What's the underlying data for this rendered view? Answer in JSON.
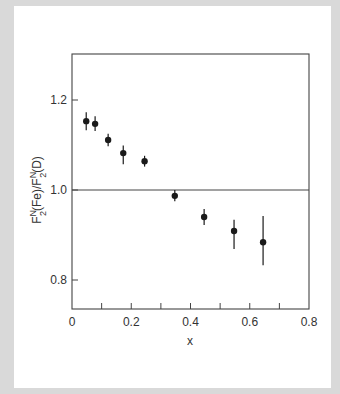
{
  "chart_data": {
    "type": "scatter",
    "title": "",
    "xlabel": "x",
    "ylabel": "F2N(Fe)/F2N(D)",
    "ylabel_parts": {
      "f1": "F",
      "sub1": "2",
      "sup1": "N",
      "mid": "(Fe)/F",
      "sub2": "2",
      "sup2": "N",
      "end": "(D)"
    },
    "xlim": [
      0,
      0.8
    ],
    "ylim": [
      0.735,
      1.295
    ],
    "x_ticks": [
      0,
      0.2,
      0.4,
      0.6,
      0.8
    ],
    "x_tick_labels": [
      "0",
      "0.2",
      "0.4",
      "0.6",
      "0.8"
    ],
    "x_minor_ticks": [
      0.1,
      0.2,
      0.3,
      0.4,
      0.5,
      0.6,
      0.7
    ],
    "y_ticks": [
      0.8,
      1.0,
      1.2
    ],
    "y_tick_labels": [
      "0.8",
      "1.0",
      "1.2"
    ],
    "reference_line": 1.0,
    "grid": false,
    "legend": null,
    "series": [
      {
        "name": "Fe/D ratio",
        "points": [
          {
            "x": 0.048,
            "y": 1.153,
            "err_low": 0.02,
            "err_high": 0.02
          },
          {
            "x": 0.078,
            "y": 1.147,
            "err_low": 0.016,
            "err_high": 0.017
          },
          {
            "x": 0.122,
            "y": 1.111,
            "err_low": 0.014,
            "err_high": 0.014
          },
          {
            "x": 0.173,
            "y": 1.082,
            "err_low": 0.025,
            "err_high": 0.017
          },
          {
            "x": 0.245,
            "y": 1.064,
            "err_low": 0.012,
            "err_high": 0.012
          },
          {
            "x": 0.347,
            "y": 0.987,
            "err_low": 0.012,
            "err_high": 0.013
          },
          {
            "x": 0.446,
            "y": 0.94,
            "err_low": 0.018,
            "err_high": 0.018
          },
          {
            "x": 0.547,
            "y": 0.909,
            "err_low": 0.04,
            "err_high": 0.025
          },
          {
            "x": 0.645,
            "y": 0.884,
            "err_low": 0.051,
            "err_high": 0.058
          }
        ]
      }
    ]
  },
  "colors": {
    "frame": "#d9d9d9",
    "panel": "#ffffff",
    "axis": "#444444",
    "marker": "#1a1a1a"
  }
}
